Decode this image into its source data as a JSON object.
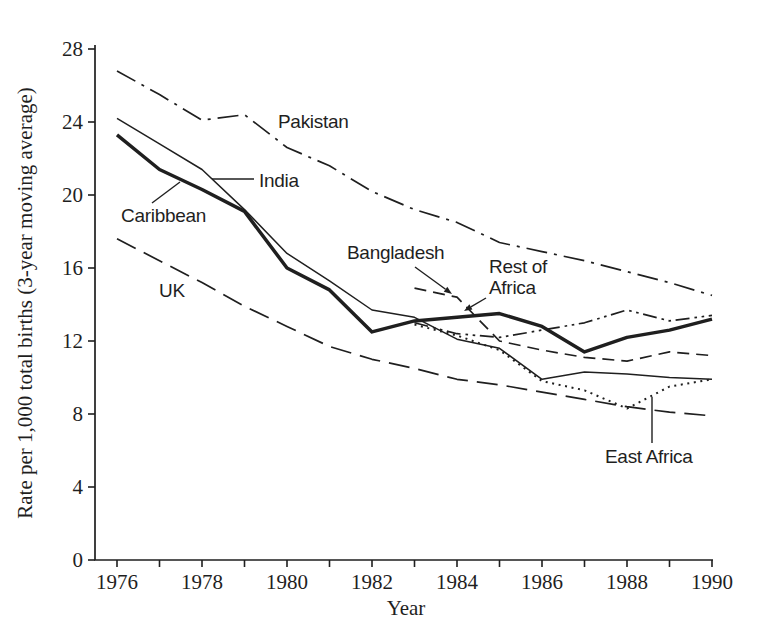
{
  "figure": {
    "background": "#ffffff",
    "ink_color": "#1f1f1f"
  },
  "chart_data": {
    "type": "line",
    "title": "",
    "xlabel": "Year",
    "ylabel": "Rate per 1,000 total births (3-year moving average)",
    "x_min": 1976,
    "x_max": 1990,
    "ylim": [
      0,
      28
    ],
    "y_ticks": [
      0,
      4,
      8,
      12,
      16,
      20,
      24,
      28
    ],
    "x_ticks": [
      1976,
      1977,
      1978,
      1979,
      1980,
      1981,
      1982,
      1983,
      1984,
      1985,
      1986,
      1987,
      1988,
      1989,
      1990
    ],
    "x_tick_labels": [
      "1976",
      "1978",
      "1980",
      "1982",
      "1984",
      "1986",
      "1988",
      "1990"
    ],
    "grid": false,
    "legend": "inline-labels",
    "series": [
      {
        "name": "Pakistan",
        "style": "dash-dot",
        "start_year": 1976,
        "values": [
          26.8,
          25.5,
          24.1,
          24.4,
          22.6,
          21.6,
          20.2,
          19.2,
          18.5,
          17.4,
          16.9,
          16.4,
          15.8,
          15.2,
          14.5
        ]
      },
      {
        "name": "UK",
        "style": "long-dash",
        "start_year": 1976,
        "values": [
          17.6,
          16.4,
          15.2,
          13.9,
          12.8,
          11.7,
          11.0,
          10.5,
          9.9,
          9.6,
          9.2,
          8.8,
          8.4,
          8.1,
          7.9
        ]
      },
      {
        "name": "India",
        "style": "solid",
        "start_year": 1976,
        "values": [
          24.2,
          22.8,
          21.4,
          19.2,
          16.8,
          15.3,
          13.7,
          13.3,
          12.1,
          11.6,
          9.9,
          10.3,
          10.2,
          10.0,
          9.9
        ]
      },
      {
        "name": "Bangladesh",
        "style": "dash",
        "start_year": 1983,
        "values": [
          14.9,
          14.4,
          12.0,
          11.5,
          11.1,
          10.9,
          11.4,
          11.2
        ]
      },
      {
        "name": "East Africa",
        "style": "dotted",
        "start_year": 1983,
        "values": [
          12.9,
          12.3,
          11.5,
          9.8,
          9.3,
          8.3,
          9.5,
          9.9
        ]
      },
      {
        "name": "Rest of Africa",
        "style": "dash-dot-dot",
        "start_year": 1983,
        "values": [
          13.0,
          12.4,
          12.2,
          12.6,
          13.0,
          13.7,
          13.1,
          13.4
        ]
      },
      {
        "name": "Caribbean",
        "style": "solid-thick",
        "start_year": 1976,
        "values": [
          23.3,
          21.4,
          20.3,
          19.1,
          16.0,
          14.8,
          12.5,
          13.1,
          13.3,
          13.5,
          12.8,
          11.4,
          12.2,
          12.6,
          13.2
        ]
      }
    ],
    "annotations": [
      {
        "id": "pakistan",
        "lines": [
          "Pakistan"
        ],
        "x": 278,
        "y": 128
      },
      {
        "id": "india",
        "lines": [
          "India"
        ],
        "x": 259,
        "y": 187,
        "leader": {
          "x1": 254,
          "y1": 179,
          "x2": 212,
          "y2": 179,
          "arrow": false
        }
      },
      {
        "id": "caribbean",
        "lines": [
          "Caribbean"
        ],
        "x": 121,
        "y": 222,
        "leader": {
          "x1": 152,
          "y1": 203,
          "x2": 180,
          "y2": 182,
          "arrow": false
        }
      },
      {
        "id": "uk",
        "lines": [
          "UK"
        ],
        "x": 159,
        "y": 297
      },
      {
        "id": "bangladesh",
        "lines": [
          "Bangladesh"
        ],
        "x": 347,
        "y": 259,
        "leader": {
          "x1": 415,
          "y1": 267,
          "x2": 452,
          "y2": 294,
          "arrow": true
        }
      },
      {
        "id": "rest-of-africa",
        "lines": [
          "Rest of",
          "Africa"
        ],
        "x": 489,
        "y": 273,
        "leader": {
          "x1": 486,
          "y1": 298,
          "x2": 464,
          "y2": 311,
          "arrow": true
        }
      },
      {
        "id": "east-africa",
        "lines": [
          "East Africa"
        ],
        "x": 605,
        "y": 463,
        "leader": {
          "x1": 652,
          "y1": 443,
          "x2": 652,
          "y2": 397,
          "arrow": false
        }
      }
    ]
  }
}
